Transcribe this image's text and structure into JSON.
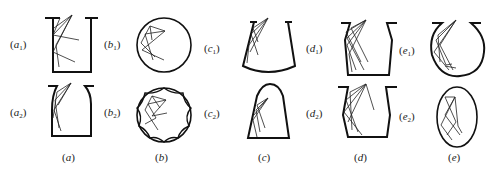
{
  "figure": {
    "panels": [
      {
        "id": "a",
        "caption": "(a)",
        "variants": [
          {
            "label": "a",
            "sub": "1",
            "shape": "rectangular vessel with rim lips"
          },
          {
            "label": "a",
            "sub": "2",
            "shape": "vessel with curved shoulders"
          }
        ]
      },
      {
        "id": "b",
        "caption": "(b)",
        "variants": [
          {
            "label": "b",
            "sub": "1",
            "shape": "circle"
          },
          {
            "label": "b",
            "sub": "2",
            "shape": "circle with scalloped inner wall"
          }
        ]
      },
      {
        "id": "c",
        "caption": "(c)",
        "variants": [
          {
            "label": "c",
            "sub": "1",
            "shape": "flared vessel with curved bottom"
          },
          {
            "label": "c",
            "sub": "2",
            "shape": "dome-topped trapezoid"
          }
        ]
      },
      {
        "id": "d",
        "caption": "(d)",
        "variants": [
          {
            "label": "d",
            "sub": "1",
            "shape": "tapered vessel with rim lips"
          },
          {
            "label": "d",
            "sub": "2",
            "shape": "angled-wall vessel"
          }
        ]
      },
      {
        "id": "e",
        "caption": "(e)",
        "variants": [
          {
            "label": "e",
            "sub": "1",
            "shape": "round-bottom flask"
          },
          {
            "label": "e",
            "sub": "2",
            "shape": "ellipse"
          }
        ]
      }
    ],
    "labels": {
      "a1": "a",
      "a2": "a",
      "b1": "b",
      "b2": "b",
      "c1": "c",
      "c2": "c",
      "d1": "d",
      "d2": "d",
      "e1": "e",
      "e2": "e",
      "sub1": "1",
      "sub2": "2",
      "cap_a": "a",
      "cap_b": "b",
      "cap_c": "c",
      "cap_d": "d",
      "cap_e": "e",
      "open": "(",
      "close": ")"
    }
  }
}
